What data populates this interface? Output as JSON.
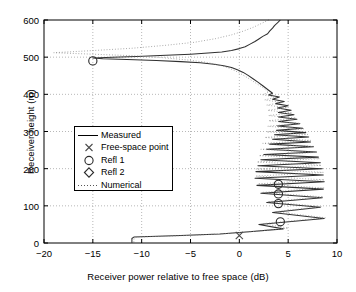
{
  "chart_data": {
    "type": "line",
    "title": "",
    "xlabel": "Receiver power relative to free space (dB)",
    "ylabel": "Receiver height (m)",
    "xlim": [
      -20,
      10
    ],
    "ylim": [
      0,
      600
    ],
    "xticks": [
      -20,
      -15,
      -10,
      -5,
      0,
      5,
      10
    ],
    "xtick_labels": [
      "-20",
      "-15",
      "-10",
      "-5",
      "0",
      "5",
      "10"
    ],
    "yticks": [
      0,
      100,
      200,
      300,
      400,
      500,
      600
    ],
    "ytick_labels": [
      "0",
      "100",
      "200",
      "300",
      "400",
      "500",
      "600"
    ],
    "grid": true,
    "grid_style": "dotted",
    "legend_position": "center-left",
    "legend": [
      {
        "label": "Measured",
        "marker": "line",
        "style": "solid"
      },
      {
        "label": "Free-space point",
        "marker": "x",
        "style": "none"
      },
      {
        "label": "Refl 1",
        "marker": "circle",
        "style": "none"
      },
      {
        "label": "Refl 2",
        "marker": "diamond",
        "style": "none"
      },
      {
        "label": "Numerical",
        "marker": "line",
        "style": "dotted"
      }
    ],
    "series": [
      {
        "name": "Measured",
        "style": "solid",
        "color": "#303030",
        "points": [
          [
            4.2,
            600
          ],
          [
            3.9,
            592
          ],
          [
            3.6,
            585
          ],
          [
            3.4,
            578
          ],
          [
            3.1,
            570
          ],
          [
            2.9,
            563
          ],
          [
            2.4,
            556
          ],
          [
            2.0,
            549
          ],
          [
            1.6,
            542
          ],
          [
            1.1,
            535
          ],
          [
            0.6,
            528
          ],
          [
            0.0,
            523
          ],
          [
            -0.8,
            518
          ],
          [
            -1.8,
            514
          ],
          [
            -3.2,
            511
          ],
          [
            -5.0,
            508
          ],
          [
            -7.5,
            505
          ],
          [
            -10.5,
            502
          ],
          [
            -13.0,
            500
          ],
          [
            -15.0,
            498
          ],
          [
            -14.0,
            496
          ],
          [
            -11.5,
            494
          ],
          [
            -8.5,
            491
          ],
          [
            -6.0,
            488
          ],
          [
            -4.0,
            485
          ],
          [
            -2.6,
            481
          ],
          [
            -1.6,
            477
          ],
          [
            -0.8,
            472
          ],
          [
            -0.2,
            466
          ],
          [
            0.4,
            459
          ],
          [
            0.9,
            451
          ],
          [
            1.4,
            442
          ],
          [
            1.9,
            433
          ],
          [
            2.4,
            423
          ],
          [
            2.9,
            413
          ],
          [
            3.4,
            403
          ],
          [
            3.0,
            398
          ],
          [
            4.1,
            393
          ],
          [
            3.4,
            387
          ],
          [
            4.6,
            381
          ],
          [
            3.7,
            375
          ],
          [
            5.0,
            369
          ],
          [
            3.9,
            363
          ],
          [
            5.3,
            357
          ],
          [
            4.0,
            351
          ],
          [
            5.6,
            345
          ],
          [
            4.0,
            339
          ],
          [
            5.9,
            333
          ],
          [
            4.0,
            327
          ],
          [
            6.2,
            321
          ],
          [
            3.9,
            315
          ],
          [
            6.5,
            309
          ],
          [
            3.8,
            303
          ],
          [
            6.8,
            297
          ],
          [
            3.6,
            291
          ],
          [
            7.1,
            285
          ],
          [
            3.4,
            279
          ],
          [
            7.3,
            272
          ],
          [
            3.1,
            266
          ],
          [
            7.6,
            259
          ],
          [
            2.8,
            252
          ],
          [
            7.9,
            245
          ],
          [
            2.5,
            238
          ],
          [
            8.1,
            231
          ],
          [
            2.2,
            224
          ],
          [
            8.3,
            216
          ],
          [
            1.9,
            208
          ],
          [
            8.5,
            200
          ],
          [
            1.7,
            192
          ],
          [
            8.6,
            183
          ],
          [
            1.6,
            174
          ],
          [
            8.7,
            165
          ],
          [
            1.8,
            155
          ],
          [
            8.6,
            145
          ],
          [
            2.2,
            134
          ],
          [
            8.5,
            122
          ],
          [
            2.8,
            109
          ],
          [
            8.3,
            96
          ],
          [
            3.4,
            82
          ],
          [
            8.7,
            66
          ],
          [
            2.0,
            50
          ],
          [
            4.5,
            38
          ],
          [
            1.0,
            30
          ],
          [
            -2.0,
            24
          ],
          [
            -6.0,
            20
          ],
          [
            -10.8,
            16
          ],
          [
            -11.0,
            12
          ],
          [
            -11.0,
            5
          ],
          [
            -11.0,
            1
          ]
        ]
      },
      {
        "name": "Numerical",
        "style": "dotted",
        "color": "#8a8a8a",
        "points": [
          [
            3.0,
            600
          ],
          [
            2.2,
            590
          ],
          [
            1.4,
            580
          ],
          [
            0.4,
            570
          ],
          [
            -0.8,
            560
          ],
          [
            -2.4,
            550
          ],
          [
            -4.6,
            540
          ],
          [
            -7.5,
            532
          ],
          [
            -11.0,
            524
          ],
          [
            -15.5,
            517
          ],
          [
            -19.0,
            512
          ],
          [
            -15.0,
            508
          ],
          [
            -11.0,
            504
          ],
          [
            -8.0,
            499
          ],
          [
            -5.5,
            493
          ],
          [
            -3.6,
            487
          ],
          [
            -2.2,
            480
          ],
          [
            -1.2,
            472
          ],
          [
            -0.4,
            463
          ],
          [
            0.3,
            453
          ],
          [
            1.0,
            442
          ],
          [
            1.7,
            430
          ],
          [
            2.4,
            418
          ],
          [
            3.0,
            406
          ],
          [
            2.4,
            399
          ],
          [
            3.8,
            392
          ],
          [
            2.6,
            385
          ],
          [
            4.4,
            378
          ],
          [
            2.8,
            371
          ],
          [
            4.9,
            364
          ],
          [
            2.9,
            357
          ],
          [
            5.4,
            350
          ],
          [
            3.0,
            343
          ],
          [
            5.8,
            336
          ],
          [
            3.0,
            329
          ],
          [
            6.2,
            322
          ],
          [
            2.9,
            314
          ],
          [
            6.6,
            307
          ],
          [
            2.8,
            299
          ],
          [
            7.0,
            292
          ],
          [
            2.6,
            284
          ],
          [
            7.3,
            276
          ],
          [
            2.4,
            268
          ],
          [
            7.6,
            260
          ],
          [
            2.2,
            252
          ],
          [
            7.9,
            244
          ],
          [
            2.0,
            235
          ],
          [
            8.2,
            227
          ],
          [
            1.8,
            218
          ],
          [
            8.4,
            209
          ],
          [
            1.7,
            199
          ],
          [
            8.6,
            190
          ],
          [
            1.7,
            180
          ],
          [
            8.7,
            170
          ],
          [
            1.9,
            159
          ],
          [
            8.7,
            148
          ],
          [
            2.3,
            136
          ],
          [
            8.6,
            124
          ],
          [
            2.9,
            111
          ],
          [
            8.4,
            98
          ],
          [
            3.6,
            84
          ],
          [
            8.8,
            68
          ],
          [
            2.4,
            52
          ],
          [
            5.0,
            40
          ],
          [
            1.5,
            31
          ],
          [
            -1.5,
            25
          ],
          [
            -5.5,
            20
          ],
          [
            -10.5,
            16
          ],
          [
            -10.8,
            10
          ],
          [
            -10.8,
            2
          ]
        ]
      }
    ],
    "markers": [
      {
        "name": "Free-space point",
        "symbol": "x",
        "x": 0.0,
        "y": 20
      },
      {
        "name": "Refl 1",
        "symbol": "circle",
        "x": -15.0,
        "y": 490
      },
      {
        "name": "Refl 1",
        "symbol": "circle",
        "x": 4.0,
        "y": 158
      },
      {
        "name": "Refl 1",
        "symbol": "circle",
        "x": 4.0,
        "y": 132
      },
      {
        "name": "Refl 1",
        "symbol": "circle",
        "x": 4.0,
        "y": 106
      },
      {
        "name": "Refl 1",
        "symbol": "circle",
        "x": 4.2,
        "y": 57
      }
    ]
  }
}
